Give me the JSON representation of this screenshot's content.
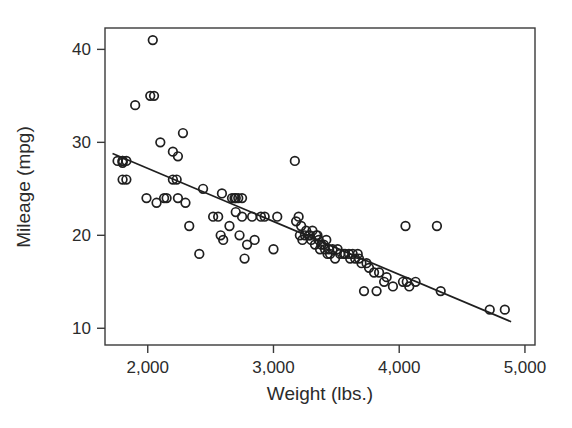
{
  "chart_data": {
    "type": "scatter",
    "title": "",
    "xlabel": "Weight (lbs.)",
    "ylabel": "Mileage (mpg)",
    "xlim": [
      1660,
      5080
    ],
    "ylim": [
      8.2,
      42.3
    ],
    "xticks": [
      2000,
      3000,
      4000,
      5000
    ],
    "xtick_labels": [
      "2,000",
      "3,000",
      "4,000",
      "5,000"
    ],
    "yticks": [
      10,
      20,
      30,
      40
    ],
    "ytick_labels": [
      "10",
      "20",
      "30",
      "40"
    ],
    "grid": false,
    "legend": null,
    "marker": "open-circle",
    "marker_color": "#1f1f1f",
    "series": [
      {
        "name": "Cars",
        "x": [
          1760,
          1800,
          1800,
          1800,
          1800,
          1830,
          1830,
          1900,
          1990,
          2020,
          2040,
          2050,
          2070,
          2100,
          2130,
          2150,
          2200,
          2200,
          2230,
          2240,
          2240,
          2280,
          2300,
          2330,
          2410,
          2440,
          2520,
          2560,
          2580,
          2590,
          2600,
          2650,
          2670,
          2690,
          2700,
          2700,
          2720,
          2730,
          2750,
          2750,
          2770,
          2790,
          2830,
          2850,
          2900,
          2930,
          3000,
          3030,
          3170,
          3180,
          3200,
          3210,
          3220,
          3230,
          3250,
          3260,
          3280,
          3290,
          3300,
          3310,
          3330,
          3340,
          3350,
          3360,
          3370,
          3380,
          3400,
          3410,
          3420,
          3430,
          3440,
          3450,
          3470,
          3490,
          3510,
          3530,
          3560,
          3570,
          3600,
          3610,
          3630,
          3650,
          3670,
          3680,
          3700,
          3720,
          3740,
          3760,
          3800,
          3820,
          3840,
          3880,
          3900,
          3950,
          4030,
          4050,
          4060,
          4080,
          4130,
          4300,
          4330,
          4720,
          4840
        ],
        "y": [
          28.0,
          28.0,
          28.0,
          27.8,
          26.0,
          28.0,
          26.0,
          34.0,
          24.0,
          35.0,
          41.0,
          35.0,
          23.5,
          30.0,
          24.0,
          24.0,
          26.0,
          29.0,
          26.0,
          24.0,
          28.5,
          31.0,
          23.5,
          21.0,
          18.0,
          25.0,
          22.0,
          22.0,
          20.0,
          24.5,
          19.5,
          21.0,
          24.0,
          24.0,
          24.0,
          22.5,
          24.0,
          20.0,
          24.0,
          22.0,
          17.5,
          19.0,
          22.0,
          19.5,
          22.0,
          22.0,
          18.5,
          22.0,
          28.0,
          21.5,
          22.0,
          20.0,
          21.0,
          19.5,
          20.0,
          20.5,
          20.0,
          20.0,
          19.5,
          20.5,
          19.0,
          20.0,
          20.0,
          19.5,
          18.5,
          19.0,
          19.0,
          18.5,
          19.5,
          18.0,
          18.5,
          18.0,
          18.5,
          17.5,
          18.5,
          18.0,
          18.0,
          18.0,
          18.0,
          17.5,
          18.0,
          17.5,
          18.0,
          17.5,
          17.0,
          14.0,
          17.0,
          16.5,
          16.0,
          14.0,
          16.0,
          15.0,
          15.5,
          14.5,
          15.0,
          21.0,
          15.0,
          14.5,
          15.0,
          21.0,
          14.0,
          12.0,
          12.0
        ]
      }
    ],
    "trendline": {
      "name": "least-squares fit",
      "x_start": 1720,
      "y_start": 28.8,
      "x_end": 4890,
      "y_end": 10.7
    }
  },
  "axes": {
    "x_title": "Weight (lbs.)",
    "y_title": "Mileage (mpg)"
  }
}
